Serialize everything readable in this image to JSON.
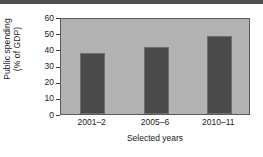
{
  "chart_data": {
    "type": "bar",
    "title": "",
    "subtitle": "",
    "categories": [
      "2001–2",
      "2005–6",
      "2010–11"
    ],
    "values": [
      38,
      41.5,
      48
    ],
    "series": [
      {
        "name": "Public spending",
        "values": [
          38,
          41.5,
          48
        ]
      }
    ],
    "xlabel": "Selected years",
    "ylabel_line1": "Public spending",
    "ylabel_line2": "(% of GDP)",
    "ylabel": "Public spending (% of GDP)",
    "ylim": [
      0,
      60
    ],
    "yticks": [
      0,
      10,
      20,
      30,
      40,
      50,
      60
    ],
    "ytick_labels": [
      "0",
      "10",
      "20",
      "30",
      "40",
      "50",
      "60"
    ],
    "grid": false,
    "legend": false,
    "legend_position": "none",
    "colors": {
      "bar": "#4a4a4a",
      "bar_edge": "#6e6e6e",
      "plot_background": "#b2b2b2",
      "axis": "#5a5a5a",
      "text": "#1a1a1a",
      "top_band": "#4f4f4f",
      "page_background": "#ffffff"
    }
  }
}
